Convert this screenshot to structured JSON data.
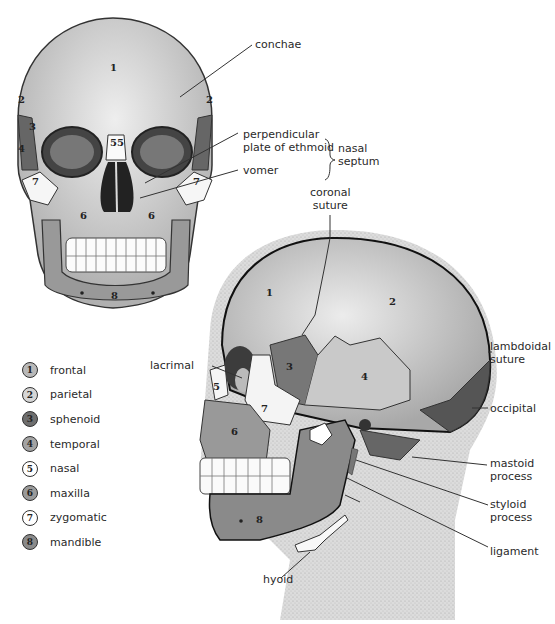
{
  "figure": {
    "front_view": {
      "bone_numbers": [
        "1",
        "2",
        "2",
        "3",
        "4",
        "5",
        "5",
        "6",
        "6",
        "7",
        "7",
        "8"
      ],
      "callouts": {
        "conchae": "conchae",
        "perpendicular_plate": "perpendicular\nplate of ethmoid",
        "perpendicular_line1": "perpendicular",
        "perpendicular_line2": "plate of ethmoid",
        "vomer": "vomer",
        "nasal_septum_line1": "nasal",
        "nasal_septum_line2": "septum"
      }
    },
    "side_view": {
      "bone_numbers": [
        "1",
        "2",
        "3",
        "4",
        "5",
        "6",
        "7",
        "8"
      ],
      "callouts": {
        "coronal_line1": "coronal",
        "coronal_line2": "suture",
        "lacrimal": "lacrimal",
        "lambdoidal_line1": "lambdoidal",
        "lambdoidal_line2": "suture",
        "occipital": "occipital",
        "mastoid_line1": "mastoid",
        "mastoid_line2": "process",
        "styloid_line1": "styloid",
        "styloid_line2": "process",
        "ligament": "ligament",
        "hyoid": "hyoid"
      }
    },
    "legend": [
      {
        "num": "1",
        "label": "frontal",
        "color": "#b9b9b9"
      },
      {
        "num": "2",
        "label": "parietal",
        "color": "#d6d6d6"
      },
      {
        "num": "3",
        "label": "sphenoid",
        "color": "#6e6e6e"
      },
      {
        "num": "4",
        "label": "temporal",
        "color": "#a3a3a3"
      },
      {
        "num": "5",
        "label": "nasal",
        "color": "#ffffff"
      },
      {
        "num": "6",
        "label": "maxilla",
        "color": "#9a9a9a"
      },
      {
        "num": "7",
        "label": "zygomatic",
        "color": "#ffffff"
      },
      {
        "num": "8",
        "label": "mandible",
        "color": "#8a8a8a"
      }
    ]
  }
}
